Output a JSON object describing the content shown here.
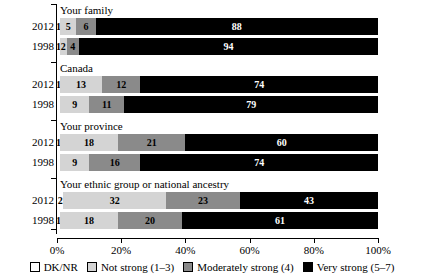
{
  "chart_data": {
    "type": "bar",
    "orientation": "horizontal",
    "stacked": true,
    "title": "",
    "xlabel": "",
    "ylabel": "",
    "xlim": [
      0,
      100
    ],
    "xticks": [
      "0%",
      "20%",
      "40%",
      "60%",
      "80%",
      "100%"
    ],
    "xtick_values": [
      0,
      20,
      40,
      60,
      80,
      100
    ],
    "grid": false,
    "legend_position": "bottom",
    "series": [
      {
        "name": "DK/NR",
        "key": "dknr",
        "color": "#ffffff"
      },
      {
        "name": "Not strong (1–3)",
        "key": "notstrong",
        "color": "#d4d4d4"
      },
      {
        "name": "Moderately strong (4)",
        "key": "moderate",
        "color": "#8a8a8a"
      },
      {
        "name": "Very strong (5–7)",
        "key": "very",
        "color": "#000000"
      }
    ],
    "groups": [
      {
        "label": "Your family",
        "rows": [
          {
            "year": "2012",
            "values": [
              1,
              5,
              6,
              88
            ],
            "labels": [
              "1",
              "5",
              "6",
              "88"
            ]
          },
          {
            "year": "1998",
            "values": [
              1,
              2,
              4,
              94
            ],
            "labels": [
              "1",
              "2",
              "4",
              "94"
            ]
          }
        ]
      },
      {
        "label": "Canada",
        "rows": [
          {
            "year": "2012",
            "values": [
              1,
              13,
              12,
              74
            ],
            "labels": [
              "1",
              "13",
              "12",
              "74"
            ]
          },
          {
            "year": "1998",
            "values": [
              1,
              9,
              11,
              79
            ],
            "labels": [
              "",
              "9",
              "11",
              "79"
            ]
          }
        ]
      },
      {
        "label": "Your province",
        "rows": [
          {
            "year": "2012",
            "values": [
              1,
              18,
              21,
              60
            ],
            "labels": [
              "1",
              "18",
              "21",
              "60"
            ]
          },
          {
            "year": "1998",
            "values": [
              1,
              9,
              16,
              74
            ],
            "labels": [
              "",
              "9",
              "16",
              "74"
            ]
          }
        ]
      },
      {
        "label": "Your ethnic group or national ancestry",
        "rows": [
          {
            "year": "2012",
            "values": [
              2,
              32,
              23,
              43
            ],
            "labels": [
              "2",
              "32",
              "23",
              "43"
            ]
          },
          {
            "year": "1998",
            "values": [
              1,
              18,
              20,
              61
            ],
            "labels": [
              "1",
              "18",
              "20",
              "61"
            ]
          }
        ]
      }
    ]
  },
  "legend": {
    "items": [
      {
        "label": "DK/NR",
        "color": "#ffffff"
      },
      {
        "label": "Not strong (1–3)",
        "color": "#d4d4d4"
      },
      {
        "label": "Moderately strong (4)",
        "color": "#8a8a8a"
      },
      {
        "label": "Very strong (5–7)",
        "color": "#000000"
      }
    ]
  }
}
